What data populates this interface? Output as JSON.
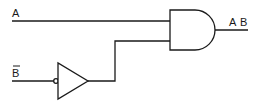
{
  "diagram": {
    "type": "logic-circuit",
    "inputs": [
      {
        "id": "A",
        "label": "A",
        "overbar": false
      },
      {
        "id": "B_bar",
        "label": "B",
        "overbar": true
      }
    ],
    "gates": [
      {
        "id": "buffer",
        "kind": "buffer-with-inverted-input",
        "input": "B_bar"
      },
      {
        "id": "and",
        "kind": "AND",
        "inputs": [
          "A",
          "buffer"
        ]
      }
    ],
    "output": {
      "label_parts": [
        "A",
        "B"
      ],
      "label": "A B"
    },
    "colors": {
      "line": "#1a1a1a",
      "background": "#ffffff"
    }
  }
}
